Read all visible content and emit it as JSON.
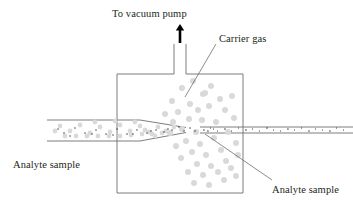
{
  "figure": {
    "type": "schematic-diagram",
    "background_color": "#ffffff"
  },
  "labels": {
    "vacuum_pump": "To vacuum pump",
    "carrier_gas": "Carrier gas",
    "analyte_sample_left": "Analyte sample",
    "analyte_sample_right": "Analyte sample"
  },
  "colors": {
    "outline": "#6d6e71",
    "particle": "#d9d9d9",
    "dot": "#3a3a3a",
    "arrow": "#000000",
    "leader": "#6d6e71",
    "text": "#231f20"
  },
  "geometry": {
    "chamber": {
      "x": 117,
      "y": 74,
      "width": 126,
      "height": 119
    },
    "vacuum_tube": {
      "x_left": 174,
      "x_right": 186,
      "y_top": 44,
      "y_bottom": 74
    },
    "arrow": {
      "x": 180,
      "y_top": 24,
      "y_bottom": 43
    },
    "inlet_tube": {
      "x_start": 47,
      "y_top": 120,
      "y_bottom": 141,
      "tip_x": 186,
      "tip_y": 130
    },
    "outlet_tube": {
      "x_start": 200,
      "x_end": 353,
      "y_top": 127,
      "y_bottom": 133
    }
  },
  "leader_lines": {
    "carrier_gas": {
      "x1": 216,
      "y1": 44,
      "x2": 185,
      "y2": 97
    },
    "analyte_right": {
      "x1": 272,
      "y1": 180,
      "x2": 205,
      "y2": 134
    }
  },
  "particles": {
    "chamber_count": 44,
    "inlet_count": 30,
    "outlet_dot_count": 23,
    "chamber": [
      [
        182,
        88
      ],
      [
        193,
        81
      ],
      [
        203,
        94
      ],
      [
        172,
        101
      ],
      [
        190,
        104
      ],
      [
        211,
        86
      ],
      [
        220,
        99
      ],
      [
        232,
        96
      ],
      [
        198,
        110
      ],
      [
        178,
        112
      ],
      [
        209,
        106
      ],
      [
        225,
        110
      ],
      [
        189,
        119
      ],
      [
        202,
        120
      ],
      [
        216,
        122
      ],
      [
        234,
        118
      ],
      [
        173,
        122
      ],
      [
        182,
        129
      ],
      [
        196,
        132
      ],
      [
        170,
        133
      ],
      [
        186,
        141
      ],
      [
        200,
        144
      ],
      [
        214,
        138
      ],
      [
        228,
        132
      ],
      [
        176,
        146
      ],
      [
        192,
        152
      ],
      [
        206,
        155
      ],
      [
        221,
        150
      ],
      [
        236,
        143
      ],
      [
        181,
        158
      ],
      [
        197,
        164
      ],
      [
        211,
        166
      ],
      [
        226,
        161
      ],
      [
        238,
        155
      ],
      [
        188,
        172
      ],
      [
        203,
        175
      ],
      [
        218,
        172
      ],
      [
        231,
        168
      ],
      [
        194,
        183
      ],
      [
        209,
        185
      ],
      [
        224,
        180
      ],
      [
        236,
        176
      ],
      [
        205,
        93
      ],
      [
        165,
        114
      ]
    ],
    "inlet": [
      [
        60,
        126
      ],
      [
        70,
        131
      ],
      [
        80,
        125
      ],
      [
        90,
        133
      ],
      [
        100,
        127
      ],
      [
        110,
        132
      ],
      [
        120,
        125
      ],
      [
        130,
        131
      ],
      [
        140,
        126
      ],
      [
        149,
        132
      ],
      [
        158,
        127
      ],
      [
        166,
        131
      ],
      [
        174,
        127
      ],
      [
        65,
        136
      ],
      [
        76,
        136
      ],
      [
        87,
        136
      ],
      [
        98,
        136
      ],
      [
        109,
        136
      ],
      [
        120,
        136
      ],
      [
        131,
        135
      ],
      [
        142,
        134
      ],
      [
        152,
        134
      ],
      [
        162,
        133
      ],
      [
        55,
        131
      ],
      [
        95,
        122
      ],
      [
        115,
        121
      ],
      [
        135,
        122
      ],
      [
        145,
        130
      ],
      [
        155,
        136
      ],
      [
        171,
        133
      ]
    ],
    "inlet_dots": [
      [
        64,
        133
      ],
      [
        75,
        128
      ],
      [
        85,
        133
      ],
      [
        96,
        130
      ],
      [
        106,
        134
      ],
      [
        117,
        129
      ],
      [
        127,
        134
      ],
      [
        137,
        130
      ],
      [
        147,
        133
      ],
      [
        156,
        130
      ],
      [
        164,
        132
      ],
      [
        172,
        130
      ],
      [
        58,
        129
      ],
      [
        70,
        136
      ],
      [
        92,
        134
      ],
      [
        113,
        135
      ],
      [
        133,
        134
      ],
      [
        151,
        131
      ],
      [
        168,
        129
      ]
    ],
    "outlet_dots": [
      [
        203,
        130
      ],
      [
        210,
        128
      ],
      [
        217,
        131
      ],
      [
        224,
        129
      ],
      [
        231,
        131
      ],
      [
        238,
        128
      ],
      [
        245,
        130
      ],
      [
        252,
        129
      ],
      [
        259,
        131
      ],
      [
        266,
        128
      ],
      [
        273,
        130
      ],
      [
        280,
        131
      ],
      [
        287,
        129
      ],
      [
        294,
        130
      ],
      [
        301,
        128
      ],
      [
        308,
        131
      ],
      [
        315,
        129
      ],
      [
        322,
        130
      ],
      [
        329,
        131
      ],
      [
        336,
        128
      ],
      [
        343,
        130
      ],
      [
        207,
        131
      ],
      [
        213,
        129
      ]
    ],
    "nozzle_dots": [
      [
        179,
        127
      ],
      [
        184,
        131
      ],
      [
        190,
        128
      ],
      [
        195,
        131
      ]
    ]
  }
}
